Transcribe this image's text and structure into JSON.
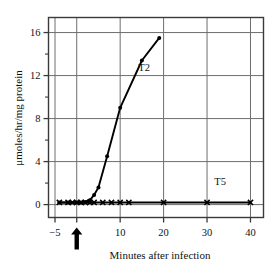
{
  "chart_data": {
    "type": "line",
    "title": "",
    "xlabel": "Minutes after infection",
    "ylabel": "μmoles/hr/mg protein",
    "xlim": [
      -6.5,
      43
    ],
    "ylim": [
      -1.2,
      17.4
    ],
    "grid": true,
    "legend_position": "inline-annotation",
    "x_ticks": [
      -5,
      0,
      10,
      20,
      30,
      40
    ],
    "x_tick_labels": [
      "−5",
      "",
      "10",
      "20",
      "30",
      "40"
    ],
    "x_gridlines": [
      -5,
      0,
      10,
      20,
      30,
      40
    ],
    "y_ticks": [
      0,
      4,
      8,
      12,
      16
    ],
    "y_tick_labels": [
      "0",
      "4",
      "8",
      "12",
      "16"
    ],
    "y_minor_ticks": [
      2,
      6,
      10,
      14
    ],
    "y_gridlines": [
      0,
      4,
      8,
      12,
      16
    ],
    "annotations": [
      {
        "name": "infection-arrow",
        "x": 0,
        "text": "↑",
        "note": "upward arrow marking time of infection"
      }
    ],
    "series": [
      {
        "name": "T2",
        "label": "T2",
        "label_x": 15.5,
        "label_y": 12.4,
        "marker": "dot",
        "x": [
          -4,
          -2,
          0,
          1,
          2,
          3,
          4,
          5,
          7,
          10,
          15,
          19
        ],
        "y": [
          0.2,
          0.2,
          0.2,
          0.2,
          0.25,
          0.4,
          0.9,
          1.6,
          4.5,
          9.0,
          13.4,
          15.5
        ]
      },
      {
        "name": "T5",
        "label": "T5",
        "label_x": 33,
        "label_y": 1.85,
        "marker": "cross",
        "x": [
          -4,
          -2,
          -1,
          0,
          1,
          2,
          3,
          4,
          6,
          8,
          10,
          12,
          20,
          30,
          40
        ],
        "y": [
          0.2,
          0.2,
          0.2,
          0.2,
          0.2,
          0.2,
          0.2,
          0.2,
          0.2,
          0.2,
          0.2,
          0.2,
          0.2,
          0.2,
          0.2
        ]
      }
    ],
    "colors": {
      "line": "#000000",
      "grid": "#6e6e6e",
      "frame": "#3a3a3a",
      "text": "#111111",
      "background": "#ffffff"
    }
  }
}
